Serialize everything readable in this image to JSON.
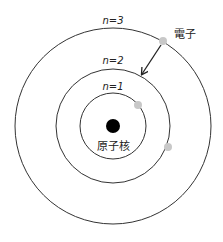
{
  "diagram": {
    "nucleus": {
      "label": "原子核",
      "color": "#000000"
    },
    "electron": {
      "label": "電子",
      "color": "#c8c8c8"
    },
    "orbits": [
      {
        "label": "n=1",
        "radius": 33
      },
      {
        "label": "n=2",
        "radius": 57
      },
      {
        "label": "n=3",
        "radius": 98
      }
    ],
    "arrow": {
      "description": "electron transition from n=3 to n=2"
    },
    "colors": {
      "line": "#222222",
      "electron": "#c8c8c8",
      "nucleus": "#000000"
    }
  }
}
